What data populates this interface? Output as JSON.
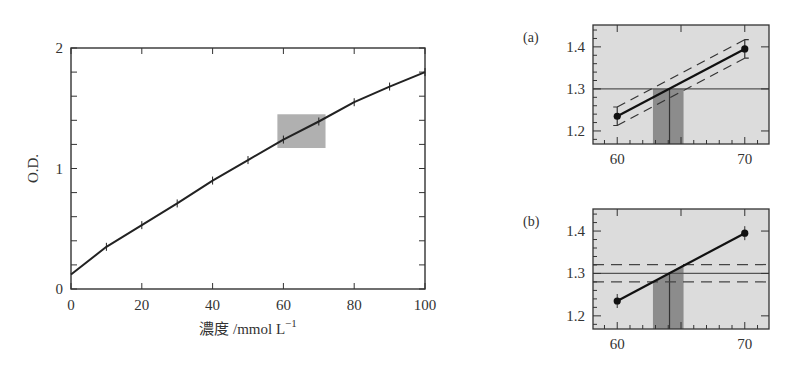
{
  "chart_data": [
    {
      "id": "main",
      "type": "line",
      "title": "",
      "xlabel": "濃度 /mmol L",
      "xlabel_superscript": "−1",
      "ylabel": "O.D.",
      "xlim": [
        0,
        100
      ],
      "ylim": [
        0,
        2
      ],
      "x_ticks": [
        0,
        20,
        40,
        60,
        80,
        100
      ],
      "x_tick_labels": [
        "0",
        "20",
        "40",
        "60",
        "80",
        "100"
      ],
      "y_ticks": [
        0,
        1,
        2
      ],
      "y_tick_labels": [
        "0",
        "1",
        "2"
      ],
      "y_minor_step": 0.2,
      "grid": false,
      "series": [
        {
          "name": "calibration curve",
          "x": [
            0,
            10,
            20,
            30,
            40,
            50,
            60,
            70,
            80,
            90,
            100
          ],
          "values": [
            0.12,
            0.35,
            0.53,
            0.71,
            0.9,
            1.07,
            1.24,
            1.39,
            1.55,
            1.68,
            1.8
          ],
          "markers": "tick"
        }
      ],
      "highlight_region": {
        "x": [
          58.3,
          71.9
        ],
        "y": [
          1.17,
          1.45
        ],
        "color": "#b0b0b0"
      }
    },
    {
      "id": "a",
      "panel_label": "(a)",
      "type": "line",
      "xlim": [
        58.1,
        71.9
      ],
      "ylim": [
        1.169,
        1.452
      ],
      "x_ticks": [
        60,
        70
      ],
      "x_tick_labels": [
        "60",
        "70"
      ],
      "y_ticks": [
        1.2,
        1.3,
        1.4
      ],
      "y_tick_labels": [
        "1.2",
        "1.3",
        "1.4"
      ],
      "points": [
        {
          "x": 60,
          "y": 1.235
        },
        {
          "x": 70,
          "y": 1.395
        }
      ],
      "confidence_band": {
        "type": "parallel",
        "offset": 0.022
      },
      "reference_line_y": 1.3,
      "x_estimate": 64.1,
      "x_interval": [
        62.8,
        65.2
      ],
      "background": "#dcdcdc",
      "band_color": "#8c8c8c"
    },
    {
      "id": "b",
      "panel_label": "(b)",
      "type": "line",
      "xlim": [
        58.1,
        71.9
      ],
      "ylim": [
        1.169,
        1.452
      ],
      "x_ticks": [
        60,
        70
      ],
      "x_tick_labels": [
        "60",
        "70"
      ],
      "y_ticks": [
        1.2,
        1.3,
        1.4
      ],
      "y_tick_labels": [
        "1.2",
        "1.3",
        "1.4"
      ],
      "points": [
        {
          "x": 60,
          "y": 1.235
        },
        {
          "x": 70,
          "y": 1.395
        }
      ],
      "confidence_band": {
        "type": "horizontal",
        "y": [
          1.28,
          1.321
        ]
      },
      "reference_line_y": 1.3,
      "x_estimate": 64.1,
      "x_interval": [
        62.8,
        65.2
      ],
      "background": "#dcdcdc",
      "band_color": "#8c8c8c"
    }
  ]
}
